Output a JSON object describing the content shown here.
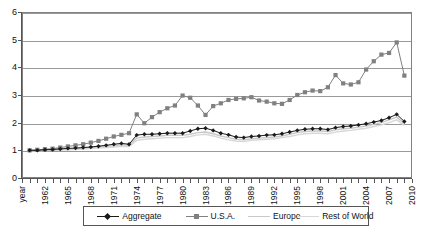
{
  "chart_data": {
    "type": "line",
    "title": "",
    "xlabel": "year",
    "ylabel": "",
    "ylim": [
      0,
      6
    ],
    "yticks": [
      0,
      1,
      2,
      3,
      4,
      5,
      6
    ],
    "xlim": [
      1959,
      2010
    ],
    "xticks": [
      1959,
      1960,
      1961,
      1962,
      1963,
      1964,
      1965,
      1966,
      1967,
      1968,
      1969,
      1970,
      1971,
      1972,
      1973,
      1974,
      1975,
      1976,
      1977,
      1978,
      1979,
      1980,
      1981,
      1982,
      1983,
      1984,
      1985,
      1986,
      1987,
      1988,
      1989,
      1990,
      1991,
      1992,
      1993,
      1994,
      1995,
      1996,
      1997,
      1998,
      1999,
      2000,
      2001,
      2002,
      2003,
      2004,
      2005,
      2006,
      2007,
      2008,
      2009,
      2010
    ],
    "xticklabels": [
      "year",
      "",
      "",
      "1962",
      "",
      "",
      "1965",
      "",
      "",
      "1968",
      "",
      "",
      "1971",
      "",
      "",
      "1974",
      "",
      "",
      "1977",
      "",
      "",
      "1980",
      "",
      "",
      "1983",
      "",
      "",
      "1986",
      "",
      "",
      "1989",
      "",
      "",
      "1992",
      "",
      "",
      "1995",
      "",
      "",
      "1998",
      "",
      "",
      "2001",
      "",
      "",
      "2004",
      "",
      "",
      "2007",
      "",
      "",
      "2010"
    ],
    "grid": true,
    "legend_position": "bottom",
    "x": [
      1960,
      1961,
      1962,
      1963,
      1964,
      1965,
      1966,
      1967,
      1968,
      1969,
      1970,
      1971,
      1972,
      1973,
      1974,
      1975,
      1976,
      1977,
      1978,
      1979,
      1980,
      1981,
      1982,
      1983,
      1984,
      1985,
      1986,
      1987,
      1988,
      1989,
      1990,
      1991,
      1992,
      1993,
      1994,
      1995,
      1996,
      1997,
      1998,
      1999,
      2000,
      2001,
      2002,
      2003,
      2004,
      2005,
      2006,
      2007,
      2008,
      2009
    ],
    "series": [
      {
        "name": "Aggregate",
        "color": "#1a1a1a",
        "marker": "diamond",
        "values": [
          1.0,
          1.0,
          1.02,
          1.03,
          1.05,
          1.07,
          1.08,
          1.1,
          1.12,
          1.15,
          1.18,
          1.22,
          1.25,
          1.22,
          1.55,
          1.58,
          1.58,
          1.6,
          1.62,
          1.62,
          1.62,
          1.7,
          1.78,
          1.8,
          1.72,
          1.62,
          1.56,
          1.48,
          1.46,
          1.5,
          1.52,
          1.55,
          1.56,
          1.6,
          1.66,
          1.72,
          1.76,
          1.78,
          1.78,
          1.75,
          1.82,
          1.86,
          1.88,
          1.92,
          1.96,
          2.02,
          2.08,
          2.18,
          2.3,
          2.04
        ]
      },
      {
        "name": "U.S.A.",
        "color": "#808080",
        "marker": "square",
        "values": [
          1.0,
          1.02,
          1.04,
          1.06,
          1.1,
          1.14,
          1.18,
          1.22,
          1.28,
          1.34,
          1.42,
          1.5,
          1.56,
          1.62,
          2.3,
          1.98,
          2.2,
          2.38,
          2.52,
          2.62,
          2.98,
          2.9,
          2.62,
          2.28,
          2.6,
          2.7,
          2.82,
          2.86,
          2.88,
          2.92,
          2.8,
          2.76,
          2.7,
          2.68,
          2.82,
          3.0,
          3.1,
          3.16,
          3.14,
          3.28,
          3.72,
          3.42,
          3.38,
          3.46,
          3.92,
          4.22,
          4.46,
          4.52,
          4.9,
          3.7
        ]
      },
      {
        "name": "Europe",
        "color": "#c8c8c8",
        "marker": "none",
        "values": [
          1.0,
          1.0,
          1.01,
          1.02,
          1.04,
          1.05,
          1.06,
          1.08,
          1.1,
          1.12,
          1.14,
          1.16,
          1.2,
          1.18,
          1.44,
          1.48,
          1.5,
          1.52,
          1.54,
          1.55,
          1.54,
          1.58,
          1.64,
          1.66,
          1.6,
          1.52,
          1.46,
          1.4,
          1.38,
          1.42,
          1.44,
          1.46,
          1.48,
          1.52,
          1.58,
          1.64,
          1.68,
          1.7,
          1.7,
          1.68,
          1.74,
          1.78,
          1.8,
          1.84,
          1.88,
          1.94,
          2.0,
          2.1,
          2.2,
          1.96
        ]
      },
      {
        "name": "Rest of World",
        "color": "#d8d8d8",
        "marker": "none",
        "values": [
          0.98,
          0.98,
          0.99,
          1.0,
          1.01,
          1.02,
          1.03,
          1.05,
          1.06,
          1.08,
          1.1,
          1.12,
          1.15,
          1.14,
          1.36,
          1.4,
          1.42,
          1.44,
          1.46,
          1.46,
          1.46,
          1.5,
          1.56,
          1.58,
          1.52,
          1.44,
          1.38,
          1.34,
          1.32,
          1.36,
          1.38,
          1.4,
          1.42,
          1.46,
          1.5,
          1.56,
          1.6,
          1.62,
          1.62,
          1.6,
          1.66,
          1.7,
          1.72,
          1.76,
          1.8,
          1.86,
          1.92,
          2.0,
          2.1,
          1.9
        ]
      }
    ]
  },
  "legend": {
    "items": [
      {
        "label": "Aggregate"
      },
      {
        "label": "U.S.A."
      },
      {
        "label": "Europe"
      },
      {
        "label": "Rest of World"
      }
    ]
  }
}
